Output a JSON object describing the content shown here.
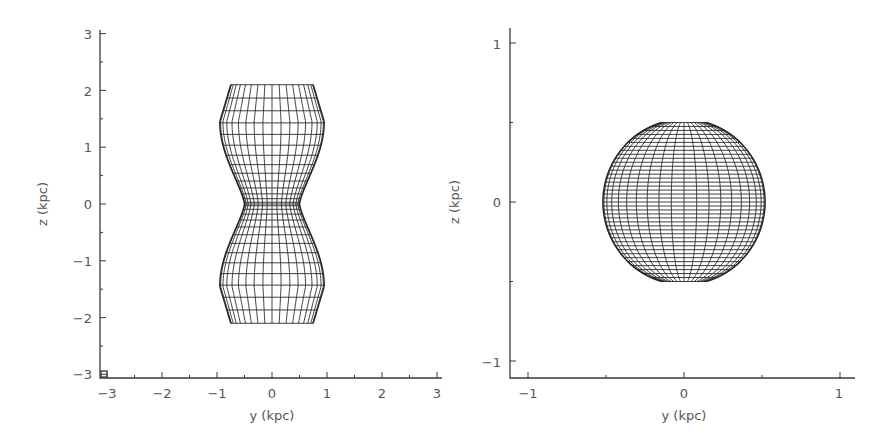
{
  "chart_data": [
    {
      "type": "scatter",
      "title": "",
      "description": "Wireframe projection of an hourglass-shaped (pinched) surface",
      "xlabel": "y (kpc)",
      "ylabel": "z (kpc)",
      "xlim": [
        -3,
        3
      ],
      "ylim": [
        -3,
        3
      ],
      "xticks": [
        "-3",
        "-2",
        "-1",
        "0",
        "1",
        "2",
        "3"
      ],
      "yticks": [
        "-3",
        "-2",
        "-1",
        "0",
        "1",
        "2",
        "3"
      ],
      "grid": false,
      "shape_profile": {
        "z": [
          2.1,
          1.45,
          1.0,
          0.5,
          0.0,
          -0.5,
          -1.0,
          -1.45,
          -2.1
        ],
        "half_width": [
          0.75,
          0.95,
          0.85,
          0.65,
          0.5,
          0.65,
          0.85,
          0.95,
          0.75
        ]
      }
    },
    {
      "type": "scatter",
      "title": "",
      "description": "Wireframe projection of a sphere truncated at the poles",
      "xlabel": "y (kpc)",
      "ylabel": "z (kpc)",
      "xlim": [
        -1.1,
        1.1
      ],
      "ylim": [
        -1.15,
        1.1
      ],
      "xticks": [
        "-1",
        "0",
        "1"
      ],
      "yticks": [
        "-1",
        "0",
        "1"
      ],
      "grid": false,
      "shape_profile": {
        "radius": 0.52,
        "z_top": 0.5,
        "z_bottom": -0.5
      }
    }
  ],
  "left": {
    "xlabel": "y (kpc)",
    "ylabel": "z (kpc)",
    "xticks": [
      "−3",
      "−2",
      "−1",
      "0",
      "1",
      "2",
      "3"
    ],
    "yticks": [
      "3",
      "2",
      "1",
      "0",
      "−1",
      "−2",
      "−3"
    ]
  },
  "right": {
    "xlabel": "y (kpc)",
    "ylabel": "z (kpc)",
    "xticks": [
      "−1",
      "0",
      "1"
    ],
    "yticks": [
      "1",
      "0",
      "−1"
    ]
  }
}
